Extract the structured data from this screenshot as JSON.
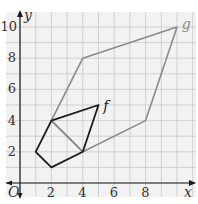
{
  "chart_data": {
    "type": "diagram",
    "title": "",
    "grid": true,
    "xlabel": "x",
    "ylabel": "y",
    "origin_label": "O",
    "xlim": [
      -1,
      11
    ],
    "ylim": [
      -1,
      11
    ],
    "x_ticks": [
      2,
      4,
      6,
      8
    ],
    "y_ticks": [
      2,
      4,
      6,
      8,
      10
    ],
    "shapes": [
      {
        "name": "f",
        "color": "#1a1a1a",
        "vertices": [
          [
            1,
            2
          ],
          [
            2,
            1
          ],
          [
            4,
            2
          ],
          [
            5,
            5
          ],
          [
            2,
            4
          ]
        ],
        "label_pos": [
          5.3,
          4.6
        ]
      },
      {
        "name": "g",
        "color": "#8a8a8a",
        "vertices": [
          [
            2,
            4
          ],
          [
            4,
            8
          ],
          [
            10,
            10
          ],
          [
            8,
            4
          ],
          [
            4,
            2
          ]
        ],
        "label_pos": [
          10.3,
          9.9
        ]
      }
    ],
    "extra_segments": [
      {
        "from": [
          2,
          4
        ],
        "to": [
          4,
          2
        ],
        "color": "#8a8a8a"
      }
    ]
  },
  "labels": {
    "x_axis": "x",
    "y_axis": "y",
    "origin": "O",
    "shape_f": "f",
    "shape_g": "g",
    "tick_x_2": "2",
    "tick_x_4": "4",
    "tick_x_6": "6",
    "tick_x_8": "8",
    "tick_y_2": "2",
    "tick_y_4": "4",
    "tick_y_6": "6",
    "tick_y_8": "8",
    "tick_y_10": "10"
  },
  "colors": {
    "grid": "#c8c8c8",
    "axis": "#1a1a1a",
    "grid_bg": "#f2f2f2"
  }
}
